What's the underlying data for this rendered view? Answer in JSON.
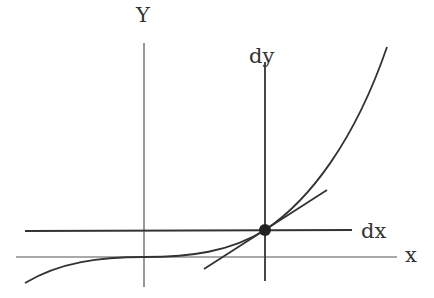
{
  "diagram": {
    "labels": {
      "y_axis": "Y",
      "x_axis": "x",
      "dy": "dy",
      "dx": "dx"
    },
    "colors": {
      "axis": "#555555",
      "line": "#333333",
      "point": "#222222"
    },
    "point": {
      "cx": 265,
      "cy": 230,
      "r": 6
    }
  }
}
